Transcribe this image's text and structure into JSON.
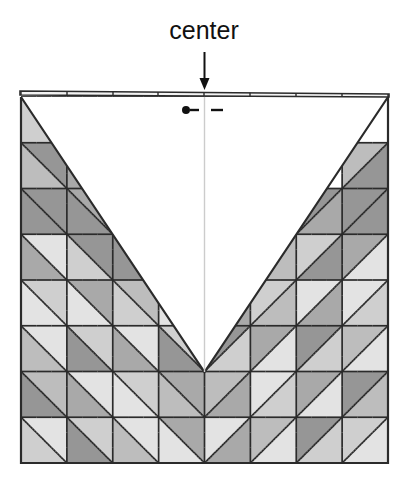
{
  "figure": {
    "kind": "origami-crease-pattern",
    "title_label": "center",
    "annotations": {
      "center_label": "center",
      "center_arrow": "down-arrow",
      "center_line": "vertical-center-line",
      "mountain_symbol": "dot-dash",
      "valley_symbol": "dash"
    },
    "colors": {
      "ink": "#2b2b2b",
      "paper": "#ffffff",
      "shade_light": "#e3e3e3",
      "shade_mid_light": "#cfcfcf",
      "shade_mid": "#bdbdbd",
      "shade_mid_dark": "#a9a9a9",
      "shade_dark": "#969696",
      "guide": "#cccccc",
      "text": "#111111"
    },
    "geometry": {
      "grid_cols": 8,
      "grid_rows": 8,
      "left": 21,
      "top": 97,
      "right": 388,
      "bottom": 463,
      "cell_w": 45.875,
      "cell_h": 45.75,
      "center_x": 204.5,
      "valley_vertex_x": 204.5,
      "valley_vertex_y": 372,
      "notch_depth_rows": 6
    },
    "top_ticks": [
      21,
      67,
      113,
      158,
      204,
      250,
      296,
      342,
      388
    ],
    "tiles": [
      {
        "r": 0,
        "c": 0,
        "d": "nwse",
        "a": "#ffffff",
        "b": "#cfcfcf"
      },
      {
        "r": 0,
        "c": 1,
        "d": "nwse",
        "a": "#ffffff",
        "b": "#ffffff"
      },
      {
        "r": 0,
        "c": 2,
        "d": "nwse",
        "a": "#ffffff",
        "b": "#ffffff"
      },
      {
        "r": 0,
        "c": 3,
        "d": "nwse",
        "a": "#ffffff",
        "b": "#ffffff"
      },
      {
        "r": 0,
        "c": 4,
        "d": "nesw",
        "a": "#ffffff",
        "b": "#ffffff"
      },
      {
        "r": 0,
        "c": 5,
        "d": "nesw",
        "a": "#ffffff",
        "b": "#ffffff"
      },
      {
        "r": 0,
        "c": 6,
        "d": "nesw",
        "a": "#ffffff",
        "b": "#ffffff"
      },
      {
        "r": 0,
        "c": 7,
        "d": "nesw",
        "a": "#cfcfcf",
        "b": "#ffffff"
      },
      {
        "r": 1,
        "c": 0,
        "d": "nwse",
        "a": "#969696",
        "b": "#bdbdbd"
      },
      {
        "r": 1,
        "c": 1,
        "d": "nwse",
        "a": "#ffffff",
        "b": "#a9a9a9"
      },
      {
        "r": 1,
        "c": 2,
        "d": "nwse",
        "a": "#ffffff",
        "b": "#ffffff"
      },
      {
        "r": 1,
        "c": 3,
        "d": "nwse",
        "a": "#ffffff",
        "b": "#ffffff"
      },
      {
        "r": 1,
        "c": 4,
        "d": "nesw",
        "a": "#ffffff",
        "b": "#ffffff"
      },
      {
        "r": 1,
        "c": 5,
        "d": "nesw",
        "a": "#ffffff",
        "b": "#ffffff"
      },
      {
        "r": 1,
        "c": 6,
        "d": "nesw",
        "a": "#a9a9a9",
        "b": "#ffffff"
      },
      {
        "r": 1,
        "c": 7,
        "d": "nesw",
        "a": "#bdbdbd",
        "b": "#969696"
      },
      {
        "r": 2,
        "c": 0,
        "d": "nwse",
        "a": "#969696",
        "b": "#969696"
      },
      {
        "r": 2,
        "c": 1,
        "d": "nwse",
        "a": "#a9a9a9",
        "b": "#969696"
      },
      {
        "r": 2,
        "c": 2,
        "d": "nwse",
        "a": "#ffffff",
        "b": "#cfcfcf"
      },
      {
        "r": 2,
        "c": 3,
        "d": "nwse",
        "a": "#ffffff",
        "b": "#ffffff"
      },
      {
        "r": 2,
        "c": 4,
        "d": "nesw",
        "a": "#ffffff",
        "b": "#ffffff"
      },
      {
        "r": 2,
        "c": 5,
        "d": "nesw",
        "a": "#cfcfcf",
        "b": "#ffffff"
      },
      {
        "r": 2,
        "c": 6,
        "d": "nesw",
        "a": "#969696",
        "b": "#a9a9a9"
      },
      {
        "r": 2,
        "c": 7,
        "d": "nesw",
        "a": "#969696",
        "b": "#969696"
      },
      {
        "r": 3,
        "c": 0,
        "d": "nwse",
        "a": "#e3e3e3",
        "b": "#a9a9a9"
      },
      {
        "r": 3,
        "c": 1,
        "d": "nwse",
        "a": "#969696",
        "b": "#cfcfcf"
      },
      {
        "r": 3,
        "c": 2,
        "d": "nwse",
        "a": "#bdbdbd",
        "b": "#969696"
      },
      {
        "r": 3,
        "c": 3,
        "d": "nwse",
        "a": "#ffffff",
        "b": "#cfcfcf"
      },
      {
        "r": 3,
        "c": 4,
        "d": "nesw",
        "a": "#cfcfcf",
        "b": "#ffffff"
      },
      {
        "r": 3,
        "c": 5,
        "d": "nesw",
        "a": "#969696",
        "b": "#bdbdbd"
      },
      {
        "r": 3,
        "c": 6,
        "d": "nesw",
        "a": "#cfcfcf",
        "b": "#969696"
      },
      {
        "r": 3,
        "c": 7,
        "d": "nesw",
        "a": "#a9a9a9",
        "b": "#e3e3e3"
      },
      {
        "r": 4,
        "c": 0,
        "d": "nwse",
        "a": "#cfcfcf",
        "b": "#e3e3e3"
      },
      {
        "r": 4,
        "c": 1,
        "d": "nwse",
        "a": "#a9a9a9",
        "b": "#e3e3e3"
      },
      {
        "r": 4,
        "c": 2,
        "d": "nwse",
        "a": "#bdbdbd",
        "b": "#cfcfcf"
      },
      {
        "r": 4,
        "c": 3,
        "d": "nwse",
        "a": "#a9a9a9",
        "b": "#e3e3e3"
      },
      {
        "r": 4,
        "c": 4,
        "d": "nesw",
        "a": "#e3e3e3",
        "b": "#a9a9a9"
      },
      {
        "r": 4,
        "c": 5,
        "d": "nesw",
        "a": "#cfcfcf",
        "b": "#bdbdbd"
      },
      {
        "r": 4,
        "c": 6,
        "d": "nesw",
        "a": "#e3e3e3",
        "b": "#a9a9a9"
      },
      {
        "r": 4,
        "c": 7,
        "d": "nesw",
        "a": "#e3e3e3",
        "b": "#cfcfcf"
      },
      {
        "r": 5,
        "c": 0,
        "d": "nwse",
        "a": "#e3e3e3",
        "b": "#bdbdbd"
      },
      {
        "r": 5,
        "c": 1,
        "d": "nwse",
        "a": "#cfcfcf",
        "b": "#969696"
      },
      {
        "r": 5,
        "c": 2,
        "d": "nwse",
        "a": "#e3e3e3",
        "b": "#a9a9a9"
      },
      {
        "r": 5,
        "c": 3,
        "d": "nwse",
        "a": "#cfcfcf",
        "b": "#969696"
      },
      {
        "r": 5,
        "c": 4,
        "d": "nesw",
        "a": "#969696",
        "b": "#cfcfcf"
      },
      {
        "r": 5,
        "c": 5,
        "d": "nesw",
        "a": "#a9a9a9",
        "b": "#e3e3e3"
      },
      {
        "r": 5,
        "c": 6,
        "d": "nesw",
        "a": "#969696",
        "b": "#cfcfcf"
      },
      {
        "r": 5,
        "c": 7,
        "d": "nesw",
        "a": "#bdbdbd",
        "b": "#e3e3e3"
      },
      {
        "r": 6,
        "c": 0,
        "d": "nwse",
        "a": "#bdbdbd",
        "b": "#969696"
      },
      {
        "r": 6,
        "c": 1,
        "d": "nwse",
        "a": "#e3e3e3",
        "b": "#a9a9a9"
      },
      {
        "r": 6,
        "c": 2,
        "d": "nwse",
        "a": "#cfcfcf",
        "b": "#e3e3e3"
      },
      {
        "r": 6,
        "c": 3,
        "d": "nwse",
        "a": "#a9a9a9",
        "b": "#bdbdbd"
      },
      {
        "r": 6,
        "c": 4,
        "d": "nesw",
        "a": "#bdbdbd",
        "b": "#a9a9a9"
      },
      {
        "r": 6,
        "c": 5,
        "d": "nesw",
        "a": "#e3e3e3",
        "b": "#cfcfcf"
      },
      {
        "r": 6,
        "c": 6,
        "d": "nesw",
        "a": "#a9a9a9",
        "b": "#e3e3e3"
      },
      {
        "r": 6,
        "c": 7,
        "d": "nesw",
        "a": "#969696",
        "b": "#bdbdbd"
      },
      {
        "r": 7,
        "c": 0,
        "d": "nwse",
        "a": "#e3e3e3",
        "b": "#cfcfcf"
      },
      {
        "r": 7,
        "c": 1,
        "d": "nwse",
        "a": "#cfcfcf",
        "b": "#969696"
      },
      {
        "r": 7,
        "c": 2,
        "d": "nwse",
        "a": "#e3e3e3",
        "b": "#bdbdbd"
      },
      {
        "r": 7,
        "c": 3,
        "d": "nwse",
        "a": "#a9a9a9",
        "b": "#e3e3e3"
      },
      {
        "r": 7,
        "c": 4,
        "d": "nesw",
        "a": "#e3e3e3",
        "b": "#a9a9a9"
      },
      {
        "r": 7,
        "c": 5,
        "d": "nesw",
        "a": "#bdbdbd",
        "b": "#e3e3e3"
      },
      {
        "r": 7,
        "c": 6,
        "d": "nesw",
        "a": "#969696",
        "b": "#cfcfcf"
      },
      {
        "r": 7,
        "c": 7,
        "d": "nesw",
        "a": "#cfcfcf",
        "b": "#e3e3e3"
      }
    ]
  }
}
